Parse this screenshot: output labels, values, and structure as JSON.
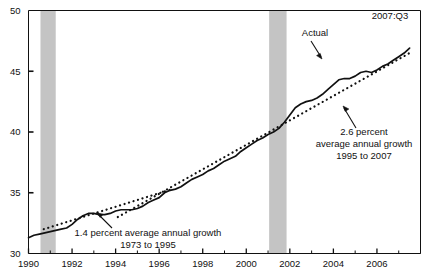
{
  "chart_data": {
    "type": "line",
    "title": "",
    "xlabel": "",
    "ylabel": "",
    "xlim": [
      1990.0,
      2008.0
    ],
    "ylim": [
      30,
      50
    ],
    "grid": false,
    "legend": "none",
    "y_ticks": [
      "30",
      "35",
      "40",
      "45",
      "50"
    ],
    "y_tick_values": [
      30,
      35,
      40,
      45,
      50
    ],
    "x_ticks": [
      "1990",
      "1992",
      "1994",
      "1996",
      "1998",
      "2000",
      "2002",
      "2004",
      "2006"
    ],
    "x_tick_values": [
      1990,
      1992,
      1994,
      1996,
      1998,
      2000,
      2002,
      2004,
      2006
    ],
    "series": [
      {
        "name": "Actual",
        "style": "solid",
        "x": [
          1990.0,
          1990.25,
          1990.5,
          1990.75,
          1991.0,
          1991.25,
          1991.5,
          1991.75,
          1992.0,
          1992.25,
          1992.5,
          1992.75,
          1993.0,
          1993.25,
          1993.5,
          1993.75,
          1994.0,
          1994.25,
          1994.5,
          1994.75,
          1995.0,
          1995.25,
          1995.5,
          1995.75,
          1996.0,
          1996.25,
          1996.5,
          1996.75,
          1997.0,
          1997.25,
          1997.5,
          1997.75,
          1998.0,
          1998.25,
          1998.5,
          1998.75,
          1999.0,
          1999.25,
          1999.5,
          1999.75,
          2000.0,
          2000.25,
          2000.5,
          2000.75,
          2001.0,
          2001.25,
          2001.5,
          2001.75,
          2002.0,
          2002.25,
          2002.5,
          2002.75,
          2003.0,
          2003.25,
          2003.5,
          2003.75,
          2004.0,
          2004.25,
          2004.5,
          2004.75,
          2005.0,
          2005.25,
          2005.5,
          2005.75,
          2006.0,
          2006.25,
          2006.5,
          2006.75,
          2007.0,
          2007.25,
          2007.5
        ],
        "y": [
          31.3,
          31.5,
          31.6,
          31.7,
          31.8,
          31.9,
          32.0,
          32.1,
          32.4,
          32.8,
          33.1,
          33.3,
          33.3,
          33.2,
          33.2,
          33.3,
          33.5,
          33.6,
          33.6,
          33.6,
          33.7,
          33.9,
          34.2,
          34.4,
          34.6,
          35.0,
          35.2,
          35.3,
          35.5,
          35.8,
          36.1,
          36.3,
          36.5,
          36.8,
          37.0,
          37.3,
          37.6,
          37.8,
          38.0,
          38.4,
          38.7,
          39.0,
          39.3,
          39.5,
          39.8,
          40.0,
          40.3,
          40.8,
          41.4,
          42.0,
          42.3,
          42.5,
          42.6,
          42.8,
          43.1,
          43.5,
          43.9,
          44.3,
          44.4,
          44.4,
          44.6,
          44.9,
          45.0,
          44.9,
          45.1,
          45.4,
          45.6,
          45.9,
          46.2,
          46.5,
          46.9
        ]
      },
      {
        "name": "1.4 percent average annual growth 1973 to 1995",
        "style": "dotted",
        "x": [
          1990.7,
          1996.6
        ],
        "y": [
          32.0,
          35.3
        ]
      },
      {
        "name": "2.6 percent average annual growth 1995 to 2007",
        "style": "dotted",
        "x": [
          1994.1,
          2007.6
        ],
        "y": [
          33.0,
          46.6
        ]
      }
    ],
    "shaded_regions": [
      {
        "label": "recession",
        "x0": 1990.55,
        "x1": 1991.25,
        "color": "#c4c4c4"
      },
      {
        "label": "recession",
        "x0": 2001.05,
        "x1": 2001.85,
        "color": "#c4c4c4"
      }
    ],
    "annotations": [
      {
        "name": "date-stamp",
        "text": "2007:Q3",
        "x": 390,
        "y": 19,
        "anchor": "middle"
      },
      {
        "name": "actual-label",
        "text": "Actual",
        "x": 315,
        "y": 36,
        "anchor": "middle"
      },
      {
        "name": "growth-1-line-1",
        "text": "1.4 percent average annual growth",
        "x": 148,
        "y": 236,
        "anchor": "middle"
      },
      {
        "name": "growth-1-line-2",
        "text": "1973 to 1995",
        "x": 148,
        "y": 248,
        "anchor": "middle"
      },
      {
        "name": "growth-2-line-1",
        "text": "2.6 percent",
        "x": 364,
        "y": 135,
        "anchor": "middle"
      },
      {
        "name": "growth-2-line-2",
        "text": "average annual growth",
        "x": 364,
        "y": 147,
        "anchor": "middle"
      },
      {
        "name": "growth-2-line-3",
        "text": "1995 to 2007",
        "x": 364,
        "y": 159,
        "anchor": "middle"
      }
    ]
  }
}
